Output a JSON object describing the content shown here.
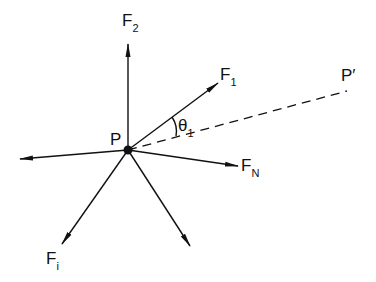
{
  "diagram": {
    "colors": {
      "stroke": "#111111",
      "background": "#ffffff"
    },
    "point": {
      "name": "P",
      "label": "P",
      "x": 128,
      "y": 150
    },
    "target_point": {
      "name": "P'",
      "label": "P′",
      "x": 347,
      "y": 91
    },
    "forces": [
      {
        "id": "F2",
        "label_main": "F",
        "label_sub": "2",
        "tip": [
          128,
          44
        ]
      },
      {
        "id": "F1",
        "label_main": "F",
        "label_sub": "1",
        "tip": [
          218,
          83
        ]
      },
      {
        "id": "FN",
        "label_main": "F",
        "label_sub": "N",
        "tip": [
          238,
          166
        ]
      },
      {
        "id": "Fi",
        "label_main": "F",
        "label_sub": "i",
        "tip": [
          62,
          244
        ]
      },
      {
        "id": "unlabeled-left",
        "label_main": "",
        "label_sub": "",
        "tip": [
          20,
          159
        ]
      },
      {
        "id": "unlabeled-down",
        "label_main": "",
        "label_sub": "",
        "tip": [
          190,
          246
        ]
      }
    ],
    "angle": {
      "label_main": "θ",
      "label_sub": "1",
      "between": [
        "F1",
        "PP'"
      ]
    },
    "dashed_line": {
      "from": "P",
      "to": "P'"
    }
  }
}
